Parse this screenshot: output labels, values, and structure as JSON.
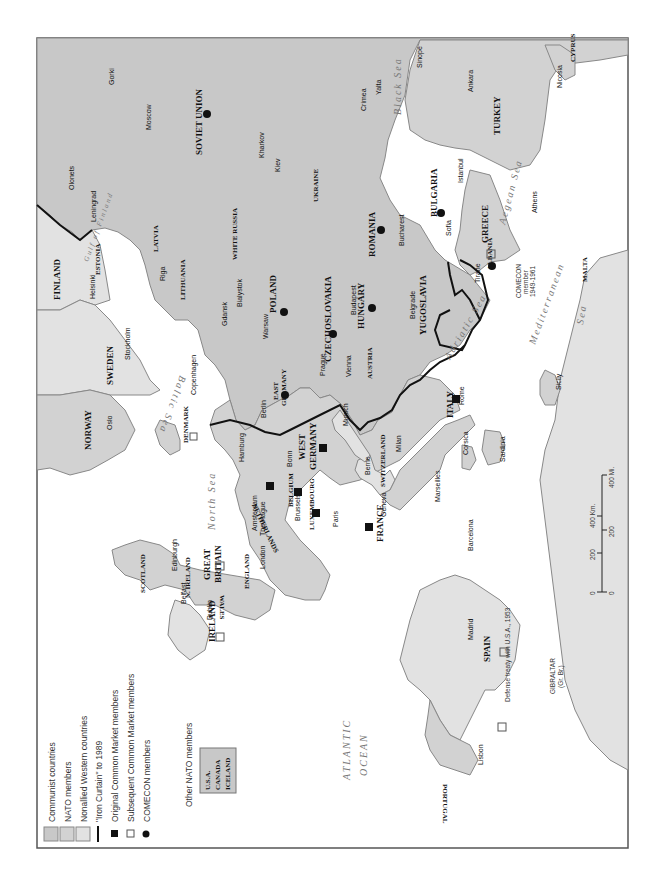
{
  "legend": {
    "items": [
      {
        "label": "Communist countries",
        "swatch": "#c8c8c8"
      },
      {
        "label": "NATO members",
        "swatch": "#d2d2d2"
      },
      {
        "label": "Nonallied Western countries",
        "swatch": "#e2e2e2"
      },
      {
        "label": "\"Iron Curtain\" to 1989",
        "swatch": "line"
      },
      {
        "label": "Original Common Market members",
        "swatch": "filled-square"
      },
      {
        "label": "Subsequent Common Market members",
        "swatch": "open-square"
      },
      {
        "label": "COMECON members",
        "swatch": "filled-circle"
      }
    ],
    "other_nato_title": "Other NATO members",
    "other_nato": [
      "U.S.A.",
      "CANADA",
      "ICELAND"
    ]
  },
  "countries": {
    "soviet_union": "SOVIET UNION",
    "finland": "FINLAND",
    "sweden": "SWEDEN",
    "norway": "NORWAY",
    "denmark": "DENMARK",
    "poland": "POLAND",
    "east_germany_1": "EAST",
    "east_germany_2": "GERMANY",
    "west_germany_1": "WEST",
    "west_germany_2": "GERMANY",
    "czechoslovakia": "CZECHOSLOVAKIA",
    "hungary": "HUNGARY",
    "romania": "ROMANIA",
    "bulgaria": "BULGARIA",
    "yugoslavia": "YUGOSLAVIA",
    "albania": "ALBANIA",
    "greece": "GREECE",
    "turkey": "TURKEY",
    "cyprus": "CYPRUS",
    "austria": "AUSTRIA",
    "switzerland": "SWITZERLAND",
    "italy": "ITALY",
    "france": "FRANCE",
    "spain": "SPAIN",
    "portugal": "PORTUGAL",
    "netherlands": "NETHERLANDS",
    "belgium": "BELGIUM",
    "luxembourg": "LUXEMBOURG",
    "great_britain_1": "GREAT",
    "great_britain_2": "BRITAIN",
    "ireland": "IRELAND",
    "scotland": "SCOTLAND",
    "england": "ENGLAND",
    "wales": "WALES",
    "n_ireland": "N. IRELAND",
    "estonia": "ESTONIA",
    "latvia": "LATVIA",
    "lithuania": "LITHUANIA",
    "white_russia": "WHITE RUSSIA",
    "ukraine": "UKRAINE",
    "malta": "MALTA",
    "gibraltar": "GIBRALTAR",
    "gibraltar_note": "(Gr. Br.)"
  },
  "cities": {
    "gorki": "Gorki",
    "moscow": "Moscow",
    "olonets": "Olonets",
    "leningrad": "Leningrad",
    "kharkov": "Kharkov",
    "kiev": "Kiev",
    "yalta": "Yalta",
    "crimea": "Crimea",
    "sinope": "Sinope",
    "ankara": "Ankara",
    "nicosia": "Nicosia",
    "istanbul": "Istanbul",
    "athens": "Athens",
    "sofia": "Sofia",
    "bucharest": "Bucharest",
    "belgrade": "Belgrade",
    "tirane": "Tirane",
    "budapest": "Budapest",
    "vienna": "Vienna",
    "prague": "Prague",
    "warsaw": "Warsaw",
    "bialystok": "Bialystok",
    "gdansk": "Gdansk",
    "riga": "Riga",
    "helsinki": "Helsinki",
    "stockholm": "Stockholm",
    "copenhagen": "Copenhagen",
    "oslo": "Oslo",
    "berlin": "Berlin",
    "hamburg": "Hamburg",
    "bonn": "Bonn",
    "munich": "Munich",
    "milan": "Milan",
    "rome": "Rome",
    "berne": "Berne",
    "geneva": "Geneva",
    "marseilles": "Marseilles",
    "paris": "Paris",
    "brussels": "Brussels",
    "amsterdam": "Amsterdam",
    "the_hague": "The Hague",
    "london": "London",
    "edinburgh": "Edinburgh",
    "belfast": "Belfast",
    "dublin": "Dublin",
    "madrid": "Madrid",
    "barcelona": "Barcelona",
    "lisbon": "Lisbon",
    "corsica": "Corsica",
    "sardinia": "Sardinia",
    "sicily": "Sicily"
  },
  "seas": {
    "black_sea": "Black Sea",
    "baltic_sea": "Baltic Sea",
    "gulf_of_finland": "Gulf of Finland",
    "north_sea": "North Sea",
    "adriatic_sea": "Adriatic Sea",
    "aegean_sea": "Aegean Sea",
    "mediterranean": "Mediterranean",
    "sea": "Sea",
    "atlantic_1": "ATLANTIC",
    "atlantic_2": "OCEAN"
  },
  "notes": {
    "albania_comecon_1": "COMECON",
    "albania_comecon_2": "member",
    "albania_comecon_3": "1949-1961",
    "spain_treaty": "Defense treaty with U.S.A., 1953"
  },
  "scale": {
    "km_label": "400 Km.",
    "mi_label": "400 Mi.",
    "km_mid": "200",
    "mi_mid": "200",
    "zero_km": "0",
    "zero_mi": "0"
  }
}
